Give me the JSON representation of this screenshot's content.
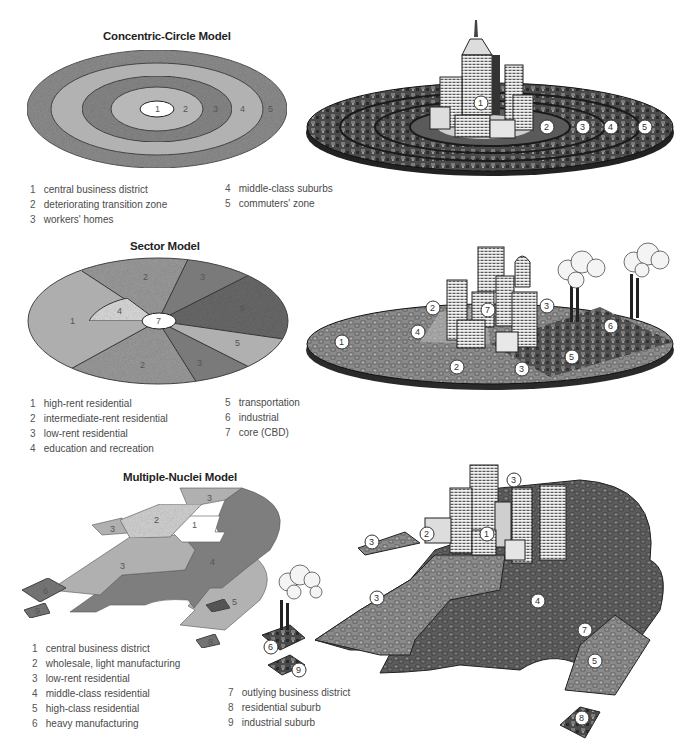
{
  "concentric": {
    "title": "Concentric-Circle Model",
    "zones": [
      "1",
      "2",
      "3",
      "4",
      "5"
    ],
    "legend": [
      {
        "num": "1",
        "label": "central business district"
      },
      {
        "num": "2",
        "label": "deteriorating transition zone"
      },
      {
        "num": "3",
        "label": "workers' homes"
      },
      {
        "num": "4",
        "label": "middle-class suburbs"
      },
      {
        "num": "5",
        "label": "commuters' zone"
      }
    ],
    "illustration_badges": [
      "1",
      "2",
      "3",
      "4",
      "5"
    ]
  },
  "sector": {
    "title": "Sector Model",
    "zones": {
      "hr": "1",
      "ir_top": "2",
      "ir_bot": "2",
      "lr_top": "3",
      "lr_bot": "3",
      "edu": "4",
      "trans": "5",
      "ind": "6",
      "core": "7"
    },
    "legend": [
      {
        "num": "1",
        "label": "high-rent residential"
      },
      {
        "num": "2",
        "label": "intermediate-rent residential"
      },
      {
        "num": "3",
        "label": "low-rent residential"
      },
      {
        "num": "4",
        "label": "education and recreation"
      },
      {
        "num": "5",
        "label": "transportation"
      },
      {
        "num": "6",
        "label": "industrial"
      },
      {
        "num": "7",
        "label": "core (CBD)"
      }
    ],
    "illustration_badges": [
      "1",
      "2",
      "4",
      "7",
      "3",
      "6",
      "2",
      "3",
      "5"
    ]
  },
  "nuclei": {
    "title": "Multiple-Nuclei Model",
    "zones": {
      "cbd": "1",
      "wholesale": "2",
      "lowrent_a": "3",
      "lowrent_b": "3",
      "lowrent_c": "3",
      "middle": "4",
      "high": "5",
      "heavy": "6",
      "ind_sub": "9",
      "res_sub": "8"
    },
    "legend": [
      {
        "num": "1",
        "label": "central business district"
      },
      {
        "num": "2",
        "label": "wholesale, light manufacturing"
      },
      {
        "num": "3",
        "label": "low-rent residential"
      },
      {
        "num": "4",
        "label": "middle-class residential"
      },
      {
        "num": "5",
        "label": "high-class residential"
      },
      {
        "num": "6",
        "label": "heavy manufacturing"
      },
      {
        "num": "7",
        "label": "outlying business district"
      },
      {
        "num": "8",
        "label": "residential suburb"
      },
      {
        "num": "9",
        "label": "industrial suburb"
      }
    ],
    "illustration_badges": [
      "3",
      "3",
      "2",
      "1",
      "3",
      "4",
      "7",
      "5",
      "6",
      "9",
      "8"
    ]
  },
  "colors": {
    "light_gray": "#b4b4b4",
    "mid_gray": "#9a9a9a",
    "dark_gray": "#6e6e6e",
    "stipple_gray": "#8c8c8c",
    "ink": "#2a2a2a"
  }
}
